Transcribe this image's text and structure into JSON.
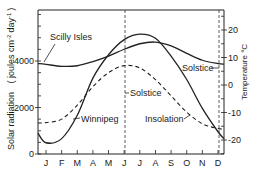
{
  "chart_data": {
    "type": "line",
    "title": "",
    "xlabel": "",
    "ylabel": "Solar radiation ( joules cm-2 day-1 )",
    "ylabel_right": "Temperature °C",
    "categories": [
      "J",
      "F",
      "M",
      "A",
      "M",
      "J",
      "J",
      "A",
      "S",
      "O",
      "N",
      "D"
    ],
    "ylim": [
      0,
      6200
    ],
    "ylim_right": [
      -25,
      27
    ],
    "left_ticks": [
      "0",
      "2000",
      "4000"
    ],
    "right_ticks": [
      "20",
      "10",
      "0",
      "-10",
      "-20"
    ],
    "grid": false,
    "series": [
      {
        "name": "Scilly Isles",
        "axis": "right",
        "style": "solid",
        "unit": "°C",
        "values": [
          7.5,
          6.8,
          7.0,
          8.5,
          10.5,
          13.0,
          15.0,
          15.6,
          14.2,
          11.5,
          9.0,
          7.8
        ]
      },
      {
        "name": "Winnipeg",
        "axis": "right",
        "style": "solid",
        "unit": "°C",
        "values": [
          -21.0,
          -19.5,
          -11.0,
          2.5,
          11.0,
          16.5,
          18.5,
          17.0,
          10.5,
          2.0,
          -8.5,
          -17.0
        ]
      },
      {
        "name": "Insolation",
        "axis": "left",
        "style": "dashed",
        "unit": "joules cm-2 day-1",
        "values": [
          1350,
          1500,
          2100,
          2900,
          3500,
          3800,
          3700,
          3200,
          2500,
          1800,
          1300,
          1100
        ]
      }
    ],
    "annotations": [
      {
        "text": "Scilly Isles",
        "target": "Scilly Isles curve"
      },
      {
        "text": "Winnipeg",
        "target": "Winnipeg curve"
      },
      {
        "text": "Insolation",
        "target": "Insolation curve"
      },
      {
        "text": "Solstice",
        "target": "June solstice dashed line"
      },
      {
        "text": "Solstice",
        "target": "December solstice dashed line"
      }
    ]
  },
  "labels": {
    "left_axis_title": "Solar radiation",
    "left_axis_units": "( joules cm",
    "left_axis_sup1": "-2",
    "left_axis_units2": "day",
    "left_axis_sup2": "-1",
    "left_axis_close": ")",
    "right_axis_title": "Temperature °C",
    "scilly": "Scilly Isles",
    "winnipeg": "Winnipeg",
    "insolation": "Insolation",
    "solstice_june": "Solstice",
    "solstice_dec": "Solstice"
  }
}
